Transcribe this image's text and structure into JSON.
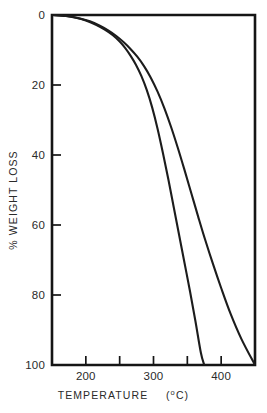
{
  "chart_data": {
    "type": "line",
    "title": "",
    "xlabel": "TEMPERATURE  (°C)",
    "xlabel_main": "TEMPERATURE",
    "xlabel_unit_open": "(",
    "xlabel_unit_sup": "o",
    "xlabel_unit_rest": "C)",
    "ylabel": "% WEIGHT  LOSS",
    "xlim": [
      150,
      450
    ],
    "ylim": [
      0,
      100
    ],
    "y_inverted": true,
    "grid": false,
    "legend": "none",
    "xticks": [
      150,
      200,
      250,
      300,
      350,
      400,
      450
    ],
    "xtick_labels": [
      "",
      "200",
      "",
      "300",
      "",
      "400",
      ""
    ],
    "yticks": [
      0,
      20,
      40,
      60,
      80,
      100
    ],
    "ytick_labels": [
      "0",
      "20",
      "40",
      "60",
      "80",
      "100"
    ],
    "series": [
      {
        "name": "curve-left",
        "x": [
          152,
          170,
          185,
          200,
          215,
          228,
          240,
          250,
          258,
          266,
          274,
          282,
          290,
          298,
          306,
          314,
          322,
          330,
          338,
          346,
          354,
          362,
          370,
          375
        ],
        "values": [
          0,
          0.3,
          0.8,
          1.6,
          2.8,
          4.2,
          5.8,
          7.6,
          9.4,
          11.6,
          14.2,
          17.4,
          21.4,
          26.4,
          32.5,
          39.5,
          47.0,
          55.0,
          63.0,
          71.0,
          79.0,
          87.5,
          96.5,
          100
        ]
      },
      {
        "name": "curve-right",
        "x": [
          152,
          172,
          190,
          206,
          220,
          233,
          245,
          256,
          266,
          276,
          286,
          296,
          306,
          316,
          326,
          336,
          346,
          356,
          366,
          376,
          388,
          400,
          414,
          430,
          450
        ],
        "values": [
          0,
          0.3,
          0.9,
          1.8,
          3.0,
          4.4,
          6.0,
          7.8,
          9.7,
          11.9,
          14.6,
          17.9,
          21.9,
          26.6,
          32.0,
          38.0,
          44.4,
          51.0,
          57.6,
          64.0,
          71.2,
          78.0,
          85.4,
          92.6,
          100
        ]
      }
    ]
  }
}
